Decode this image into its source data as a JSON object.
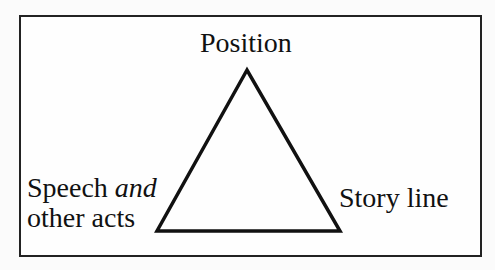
{
  "diagram": {
    "type": "triangle",
    "vertices": {
      "top": "Position",
      "bottom_left": {
        "line1_prefix": "Speech ",
        "line1_emph": "and",
        "line2": "other acts"
      },
      "bottom_right": "Story line"
    },
    "colors": {
      "stroke": "#111111",
      "background": "#fefefe"
    }
  }
}
